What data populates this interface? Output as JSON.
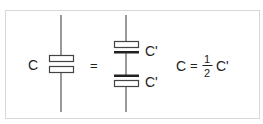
{
  "diagram": {
    "colors": {
      "background": "#ffffff",
      "frame": "#d8d8d8",
      "wire": "#555555",
      "plate_outline": "#444444",
      "plate_solid": "#222222",
      "text": "#222222"
    },
    "left": {
      "label": "C",
      "symbol": "capacitor"
    },
    "equals": "=",
    "right": {
      "components": [
        {
          "label": "C'",
          "symbol": "capacitor"
        },
        {
          "label": "C'",
          "symbol": "capacitor"
        }
      ]
    },
    "equation": {
      "lhs": "C",
      "op": "=",
      "numerator": "1",
      "denominator": "2",
      "rhs": "C'"
    }
  }
}
